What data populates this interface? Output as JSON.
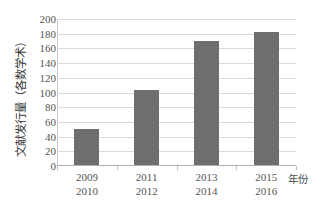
{
  "chart_data": {
    "type": "bar",
    "title": "",
    "xlabel": "年份",
    "ylabel": "文献发行量（各数学术）",
    "categories": [
      "2009\n2010",
      "2011\n2012",
      "2013\n2014",
      "2015\n2016"
    ],
    "category_lines": [
      {
        "line1": "2009",
        "line2": "2010"
      },
      {
        "line1": "2011",
        "line2": "2012"
      },
      {
        "line1": "2013",
        "line2": "2014"
      },
      {
        "line1": "2015",
        "line2": "2016"
      }
    ],
    "values": [
      51,
      103,
      170,
      182
    ],
    "ylim": [
      0,
      200
    ],
    "ytick_step": 20,
    "yticks": [
      0,
      20,
      40,
      60,
      80,
      100,
      120,
      140,
      160,
      180,
      200
    ],
    "ytick_labels": [
      "0",
      "20",
      "40",
      "60",
      "80",
      "100",
      "120",
      "140",
      "160",
      "180",
      "200"
    ],
    "grid": true,
    "grid_axis": "y",
    "legend": false,
    "legend_position": "none",
    "bar_color": "#6e6e6e",
    "gridline_color": "#d9d9d9",
    "axis_color": "#b0b0b0",
    "text_color": "#555555",
    "background": "#ffffff"
  }
}
